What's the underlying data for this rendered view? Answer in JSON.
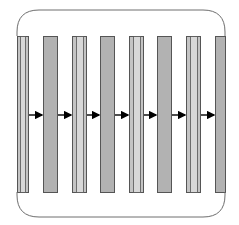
{
  "diagram": {
    "frame": {
      "x": 17,
      "y": 10,
      "width": 208,
      "height": 207,
      "radius": 22,
      "stroke": "#6e6e6e"
    },
    "layer_top": 36,
    "layer_bottom": 192,
    "arrow_y": 115,
    "colors": {
      "striped_fill": "#c4c4c4",
      "striped_inner": "#d8d8d8",
      "solid_fill": "#b2b2b2",
      "outline": "#555555",
      "arrow": "#000000"
    },
    "layers": [
      {
        "type": "striped",
        "x": 17,
        "width": 11
      },
      {
        "type": "solid",
        "x": 43,
        "width": 14
      },
      {
        "type": "striped",
        "x": 72,
        "width": 14
      },
      {
        "type": "solid",
        "x": 100,
        "width": 14
      },
      {
        "type": "striped",
        "x": 129,
        "width": 14
      },
      {
        "type": "solid",
        "x": 157,
        "width": 14
      },
      {
        "type": "striped",
        "x": 186,
        "width": 14
      },
      {
        "type": "solid",
        "x": 215,
        "width": 10
      }
    ],
    "arrows": [
      {
        "from": 28,
        "to": 43
      },
      {
        "from": 57,
        "to": 72
      },
      {
        "from": 86,
        "to": 100
      },
      {
        "from": 114,
        "to": 129
      },
      {
        "from": 143,
        "to": 157
      },
      {
        "from": 171,
        "to": 186
      },
      {
        "from": 200,
        "to": 215
      }
    ]
  }
}
